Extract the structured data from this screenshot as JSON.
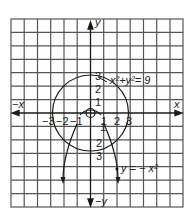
{
  "diagram": {
    "type": "coordinate-graph",
    "grid": {
      "columns": 13,
      "rows": 14,
      "color": "#555555"
    },
    "axes": {
      "x_pos_label": "x",
      "x_neg_label": "−x",
      "y_pos_label": "y",
      "y_neg_label": "−y",
      "x_ticks": [
        "−3",
        "−2",
        "−1",
        "1",
        "2",
        "3"
      ],
      "y_ticks_pos": [
        "1",
        "2",
        "3"
      ],
      "y_ticks_neg": [
        "1",
        "2",
        "3"
      ]
    },
    "curves": [
      {
        "name": "circle",
        "equation_label": "x²+y²= 9",
        "radius": 3
      },
      {
        "name": "parabola",
        "equation_label": "y = − x²"
      }
    ],
    "colors": {
      "ink": "#1a1a1a",
      "grid": "#555555",
      "background": "#ffffff"
    }
  }
}
